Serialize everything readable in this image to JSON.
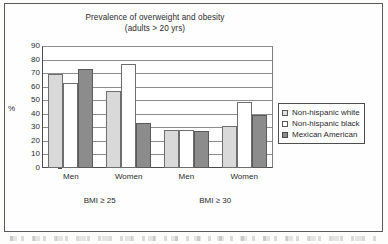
{
  "chart_data": {
    "type": "bar",
    "title": "Prevalence of overweight and obesity",
    "subtitle": "(adults > 20 yrs)",
    "xlabel": "",
    "ylabel": "%",
    "ylim": [
      0,
      90
    ],
    "yticks": [
      0,
      10,
      20,
      30,
      40,
      50,
      60,
      70,
      80,
      90
    ],
    "grid": true,
    "legend_position": "right",
    "categories": [
      "Men",
      "Women",
      "Men",
      "Women"
    ],
    "group_labels": [
      "BMI ≥ 25",
      "BMI ≥ 30"
    ],
    "series": [
      {
        "name": "Non-hispanic white",
        "values": [
          69,
          57,
          28,
          31
        ],
        "color": "#d9d9d9"
      },
      {
        "name": "Non-hispanic black",
        "values": [
          63,
          77,
          28,
          49
        ],
        "color": "#ffffff"
      },
      {
        "name": "Mexican American",
        "values": [
          73,
          33,
          27,
          39
        ],
        "color": "#8c8c8c"
      }
    ]
  },
  "legend": {
    "items": [
      {
        "label": "Non-hispanic white"
      },
      {
        "label": "Non-hispanic black"
      },
      {
        "label": "Mexican American"
      }
    ]
  }
}
